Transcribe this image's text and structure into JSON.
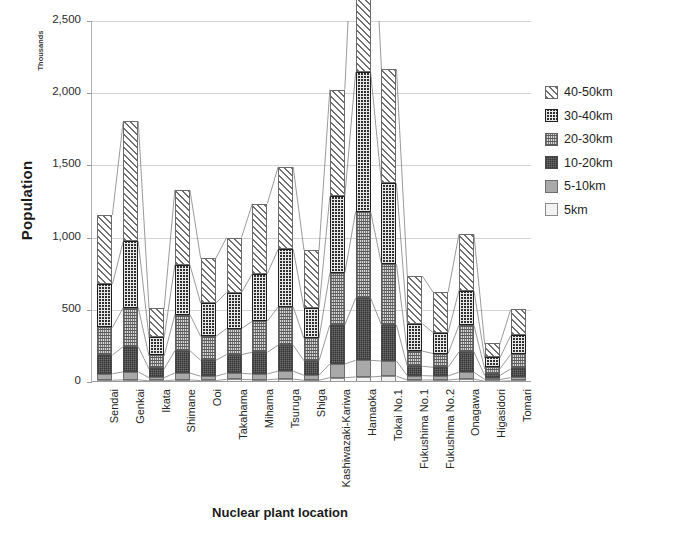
{
  "chart_data": {
    "type": "bar",
    "subtype": "stacked-column-with-connectors",
    "title": "",
    "xlabel": "Nuclear plant location",
    "ylabel": "Population",
    "y_unit_label": "Thousands",
    "ylim": [
      0,
      2500
    ],
    "ytick_values": [
      0,
      500,
      1000,
      1500,
      2000,
      2500
    ],
    "ytick_labels": [
      "0",
      "500",
      "1,000",
      "1,500",
      "2,000",
      "2,500"
    ],
    "grid": true,
    "legend_position": "right",
    "categories": [
      "Sendai",
      "Genkai",
      "Ikata",
      "Shimane",
      "Ooi",
      "Takahama",
      "Mihama",
      "Tsuruga",
      "Shiga",
      "Kashiwazaki-Kariwa",
      "Hamaoka",
      "Tokai No.1",
      "Fukushima No.1",
      "Fukushima No.2",
      "Onagawa",
      "Higasidori",
      "Tomari"
    ],
    "series": [
      {
        "name": "5km",
        "values": [
          12,
          15,
          8,
          14,
          10,
          18,
          16,
          20,
          12,
          30,
          35,
          40,
          14,
          14,
          20,
          5,
          8
        ]
      },
      {
        "name": "5-10km",
        "values": [
          45,
          55,
          22,
          48,
          30,
          42,
          40,
          55,
          35,
          95,
          115,
          105,
          30,
          28,
          48,
          12,
          22
        ]
      },
      {
        "name": "10-20km",
        "values": [
          130,
          175,
          60,
          155,
          110,
          130,
          150,
          180,
          100,
          270,
          430,
          250,
          65,
          60,
          140,
          28,
          60
        ]
      },
      {
        "name": "20-30km",
        "values": [
          190,
          270,
          90,
          250,
          165,
          180,
          215,
          265,
          155,
          360,
          600,
          420,
          105,
          95,
          185,
          45,
          100
        ]
      },
      {
        "name": "30-40km",
        "values": [
          300,
          460,
          125,
          345,
          230,
          250,
          330,
          400,
          210,
          530,
          965,
          560,
          190,
          145,
          240,
          75,
          130
        ]
      },
      {
        "name": "40-50km",
        "values": [
          480,
          830,
          200,
          520,
          310,
          380,
          485,
          570,
          400,
          740,
          1490,
          790,
          330,
          280,
          390,
          95,
          180
        ]
      }
    ],
    "stack_order_bottom_to_top": [
      "5km",
      "5-10km",
      "10-20km",
      "20-30km",
      "30-40km",
      "40-50km"
    ],
    "stacked_totals": [
      1100,
      1480,
      345,
      720,
      450,
      490,
      775,
      880,
      680,
      1150,
      2150,
      1510,
      605,
      530,
      735,
      130,
      270
    ],
    "legend": [
      {
        "label": "40-50km",
        "pattern": "diagonal-hatch"
      },
      {
        "label": "30-40km",
        "pattern": "dark-checkered"
      },
      {
        "label": "20-30km",
        "pattern": "medium-dotted"
      },
      {
        "label": "10-20km",
        "pattern": "dark-dense"
      },
      {
        "label": "5-10km",
        "pattern": "solid-gray"
      },
      {
        "label": "5km",
        "pattern": "light-gray"
      }
    ]
  }
}
